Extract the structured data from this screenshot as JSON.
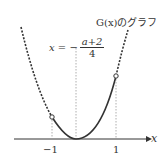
{
  "title": "G(x)のグラフ",
  "equation": {
    "lhs": "x = −",
    "numerator": "a+2",
    "denominator": "4"
  },
  "axis": {
    "x_label": "x",
    "ticks": [
      "−1",
      "1"
    ]
  },
  "colors": {
    "curve": "#333333",
    "guide": "#999999"
  }
}
